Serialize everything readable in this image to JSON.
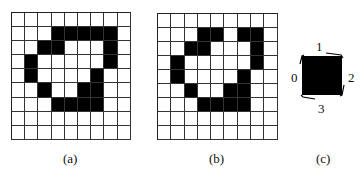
{
  "figure": {
    "panels": [
      {
        "id": "a",
        "caption": "(a)",
        "grid": {
          "rows": 9,
          "cols": 9,
          "filled": [
            [],
            [
              3,
              4,
              5,
              6,
              7
            ],
            [
              2,
              3,
              7
            ],
            [
              1,
              7
            ],
            [
              1,
              6
            ],
            [
              2,
              5,
              6
            ],
            [
              3,
              4,
              5,
              6
            ],
            [],
            []
          ]
        }
      },
      {
        "id": "b",
        "caption": "(b)",
        "grid": {
          "rows": 9,
          "cols": 9,
          "filled": [
            [],
            [
              3,
              4,
              6,
              7
            ],
            [
              2,
              3,
              7
            ],
            [
              1,
              7
            ],
            [
              1,
              6
            ],
            [
              2,
              5,
              6
            ],
            [
              3,
              4,
              5,
              6
            ],
            [],
            []
          ]
        }
      },
      {
        "id": "c",
        "caption": "(c)",
        "pixel": {
          "direction_labels": {
            "left": "0",
            "top": "1",
            "right": "2",
            "bottom": "3"
          },
          "circulation": "clockwise"
        }
      }
    ]
  },
  "colors": {
    "ink": "#000000",
    "grid_line": "#333333",
    "background": "#ffffff"
  }
}
